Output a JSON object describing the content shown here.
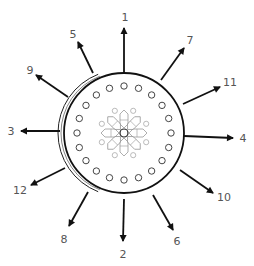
{
  "diagram": {
    "type": "radial-arrow-diagram",
    "center": [
      124,
      133
    ],
    "main_circle_radius": 60,
    "outer_crescent": {
      "cx": 120,
      "cy": 133,
      "r": 62,
      "side": "left"
    },
    "dot_ring": {
      "count": 20,
      "radius": 47,
      "dot_radius": 3.2
    },
    "flower": {
      "petals": 8,
      "inner_dots": 8
    },
    "colors": {
      "stroke": "#111111",
      "label": "#555555",
      "flower": "#999999",
      "dot": "#444444"
    },
    "arrows": [
      {
        "label": "1",
        "x1": 124,
        "y1": 73,
        "x2": 124,
        "y2": 28,
        "lx": 125,
        "ly": 21
      },
      {
        "label": "7",
        "x1": 161,
        "y1": 80,
        "x2": 184,
        "y2": 48,
        "lx": 190,
        "ly": 44
      },
      {
        "label": "11",
        "x1": 183,
        "y1": 104,
        "x2": 220,
        "y2": 87,
        "lx": 230,
        "ly": 86
      },
      {
        "label": "4",
        "x1": 184,
        "y1": 136,
        "x2": 233,
        "y2": 138,
        "lx": 243,
        "ly": 142
      },
      {
        "label": "10",
        "x1": 180,
        "y1": 170,
        "x2": 213,
        "y2": 193,
        "lx": 224,
        "ly": 201
      },
      {
        "label": "6",
        "x1": 153,
        "y1": 195,
        "x2": 173,
        "y2": 230,
        "lx": 177,
        "ly": 245
      },
      {
        "label": "2",
        "x1": 124,
        "y1": 199,
        "x2": 123,
        "y2": 241,
        "lx": 123,
        "ly": 258
      },
      {
        "label": "8",
        "x1": 88,
        "y1": 192,
        "x2": 69,
        "y2": 226,
        "lx": 64,
        "ly": 243
      },
      {
        "label": "12",
        "x1": 65,
        "y1": 168,
        "x2": 31,
        "y2": 185,
        "lx": 20,
        "ly": 194
      },
      {
        "label": "3",
        "x1": 60,
        "y1": 131,
        "x2": 21,
        "y2": 131,
        "lx": 11,
        "ly": 135
      },
      {
        "label": "9",
        "x1": 68,
        "y1": 97,
        "x2": 36,
        "y2": 75,
        "lx": 30,
        "ly": 74
      },
      {
        "label": "5",
        "x1": 93,
        "y1": 73,
        "x2": 78,
        "y2": 42,
        "lx": 73,
        "ly": 38
      }
    ]
  }
}
